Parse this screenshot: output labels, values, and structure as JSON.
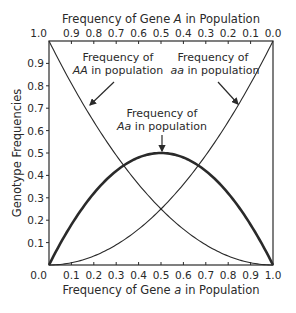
{
  "chart_data": {
    "type": "line",
    "title": "",
    "top_xlabel": "Frequency of Gene A in Population",
    "xlabel": "Frequency of Gene a in Population",
    "ylabel": "Genotype Frequencies",
    "xlim": [
      0,
      1
    ],
    "ylim": [
      0,
      1
    ],
    "grid": false,
    "x_ticks": [
      "0.0",
      "0.1",
      "0.2",
      "0.3",
      "0.4",
      "0.5",
      "0.6",
      "0.7",
      "0.8",
      "0.9",
      "1.0"
    ],
    "top_x_ticks": [
      "1.0",
      "0.9",
      "0.8",
      "0.7",
      "0.6",
      "0.5",
      "0.4",
      "0.3",
      "0.2",
      "0.1",
      "0.0"
    ],
    "y_ticks": [
      "0.0",
      "0.1",
      "0.2",
      "0.3",
      "0.4",
      "0.5",
      "0.6",
      "0.7",
      "0.8",
      "0.9",
      "1.0"
    ],
    "x": [
      0.0,
      0.1,
      0.2,
      0.3,
      0.4,
      0.5,
      0.6,
      0.7,
      0.8,
      0.9,
      1.0
    ],
    "series": [
      {
        "name": "Frequency of AA in population",
        "formula": "(1-q)^2",
        "values": [
          1.0,
          0.81,
          0.64,
          0.49,
          0.36,
          0.25,
          0.16,
          0.09,
          0.04,
          0.01,
          0.0
        ],
        "weight": "thin"
      },
      {
        "name": "Frequency of aa in population",
        "formula": "q^2",
        "values": [
          0.0,
          0.01,
          0.04,
          0.09,
          0.16,
          0.25,
          0.36,
          0.49,
          0.64,
          0.81,
          1.0
        ],
        "weight": "thin"
      },
      {
        "name": "Frequency of Aa in population",
        "formula": "2q(1-q)",
        "values": [
          0.0,
          0.18,
          0.32,
          0.42,
          0.48,
          0.5,
          0.48,
          0.42,
          0.32,
          0.18,
          0.0
        ],
        "weight": "bold"
      }
    ],
    "annotations": [
      {
        "line1": "Frequency of",
        "line2": "AA in population"
      },
      {
        "line1": "Frequency of",
        "line2": "aa in population"
      },
      {
        "line1": "Frequency of",
        "line2": "Aa in population"
      }
    ],
    "legend": "none (inline annotations with arrows)"
  }
}
